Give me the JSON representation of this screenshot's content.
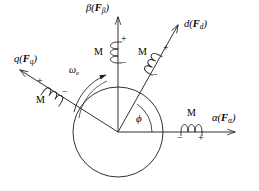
{
  "figure": {
    "type": "vector-reference-frame-diagram",
    "background_color": "#ffffff",
    "stroke_color": "#1a1a1a"
  },
  "axes": {
    "alpha": {
      "name": "alpha-axis",
      "label_greek": "α",
      "label_force_open": "(",
      "label_force_bold": "F",
      "label_force_sub": "α",
      "label_force_close": ")",
      "label_full": "α(Fα)",
      "direction_deg": 0
    },
    "beta": {
      "name": "beta-axis",
      "label_greek": "β",
      "label_force_open": "(",
      "label_force_bold": "F",
      "label_force_sub": "β",
      "label_force_close": ")",
      "label_full": "β(Fβ)",
      "direction_deg": 90
    },
    "d": {
      "name": "d-axis",
      "label_greek": "d",
      "label_force_open": "(",
      "label_force_bold": "F",
      "label_force_sub": "d",
      "label_force_close": ")",
      "label_full": "d(Fd)",
      "direction_deg": 52
    },
    "q": {
      "name": "q-axis",
      "label_greek": "q",
      "label_force_open": "(",
      "label_force_bold": "F",
      "label_force_sub": "q",
      "label_force_close": ")",
      "label_full": "q(Fq)",
      "direction_deg": 142
    }
  },
  "coils": {
    "alpha": {
      "name": "alpha-coil",
      "inductance_label": "M",
      "terminal_negative": "−",
      "terminal_positive": "+"
    },
    "beta": {
      "name": "beta-coil",
      "inductance_label": "M",
      "terminal_positive": "+",
      "terminal_negative": "−"
    },
    "d": {
      "name": "d-coil",
      "inductance_label": "M",
      "terminal_positive": "+",
      "terminal_negative": "−"
    },
    "q": {
      "name": "q-coil",
      "inductance_label": "M",
      "terminal_positive": "+",
      "terminal_negative": "−"
    }
  },
  "annotations": {
    "angular_speed": {
      "name": "angular-speed",
      "symbol": "ω",
      "subscript": "e"
    },
    "angle": {
      "name": "rotor-angle",
      "symbol": "ϕ"
    }
  },
  "rotor": {
    "name": "rotor-circle",
    "center_x": 118,
    "center_y": 132,
    "radius": 45
  }
}
